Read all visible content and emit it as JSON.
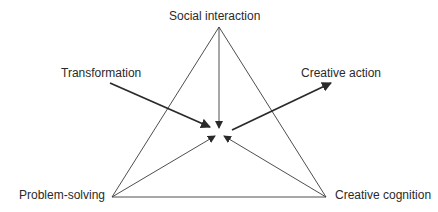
{
  "diagram": {
    "type": "triangle-model",
    "nodes": {
      "top": "Social interaction",
      "bottom_left": "Problem-solving",
      "bottom_right": "Creative cognition"
    },
    "inputs": {
      "left": "Transformation"
    },
    "outputs": {
      "right": "Creative action"
    },
    "colors": {
      "line": "#3a3a3a",
      "text": "#2a2a2a",
      "background": "#ffffff"
    }
  }
}
